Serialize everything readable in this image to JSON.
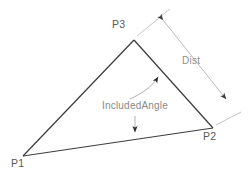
{
  "diagram": {
    "colors": {
      "triangle_stroke": "#3d3d3d",
      "dimension_stroke": "#b4b4b4",
      "leader_stroke": "#a8a8a8",
      "vertex_text": "#5a5a5a",
      "dimension_text": "#8e8e8e",
      "annotation_text": "#8a8a8a",
      "background": "#ffffff"
    },
    "vertices": [
      {
        "id": "p1",
        "label": "P1",
        "x": 23,
        "y": 156
      },
      {
        "id": "p2",
        "label": "P2",
        "x": 213,
        "y": 128
      },
      {
        "id": "p3",
        "label": "P3",
        "x": 134,
        "y": 40
      }
    ],
    "edges": [
      {
        "id": "edge-p1-p3",
        "from": "P1",
        "to": "P3"
      },
      {
        "id": "edge-p3-p2",
        "from": "P3",
        "to": "P2"
      },
      {
        "id": "edge-p1-p2",
        "from": "P1",
        "to": "P2"
      }
    ],
    "dimension": {
      "id": "dist",
      "label": "Dist",
      "measures": "P3 to P2",
      "arrow_start": {
        "x": 158,
        "y": 15
      },
      "arrow_end": {
        "x": 231,
        "y": 104
      },
      "extension_from": "P3",
      "extension_to": "P2"
    },
    "annotation": {
      "id": "included-angle",
      "label": "IncludedAngle",
      "leader_target_vertex": "P3 interior angle",
      "arrow_tip": {
        "x": 161,
        "y": 74
      },
      "secondary_arrow_tip": {
        "x": 135,
        "y": 136
      }
    }
  }
}
